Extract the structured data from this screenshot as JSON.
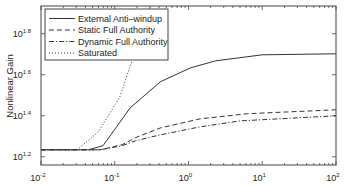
{
  "chart_data": {
    "type": "line",
    "title": "",
    "xlabel": "",
    "ylabel": "Nonlinear Gain",
    "xscale": "log",
    "yscale": "log",
    "xlim": [
      0.01,
      100
    ],
    "ylim_log10": [
      1.16,
      1.935
    ],
    "grid": false,
    "legend_position": "upper left",
    "x_ticks": [
      {
        "exp": "-2",
        "log": -2
      },
      {
        "exp": "-1",
        "log": -1
      },
      {
        "exp": "0",
        "log": 0
      },
      {
        "exp": "1",
        "log": 1
      },
      {
        "exp": "2",
        "log": 2
      }
    ],
    "y_ticks": [
      {
        "exp": "1.2",
        "log": 1.2
      },
      {
        "exp": "1.4",
        "log": 1.4
      },
      {
        "exp": "1.6",
        "log": 1.6
      },
      {
        "exp": "1.8",
        "log": 1.8
      }
    ],
    "tick_base": "10",
    "series": [
      {
        "name": "External Anti–windup",
        "style": "solid",
        "points_log10": [
          [
            -2,
            1.234
          ],
          [
            -1.36,
            1.234
          ],
          [
            -1.16,
            1.254
          ],
          [
            -0.79,
            1.439
          ],
          [
            -0.38,
            1.566
          ],
          [
            0.03,
            1.634
          ],
          [
            0.37,
            1.668
          ],
          [
            1.0,
            1.697
          ],
          [
            2.0,
            1.702
          ]
        ]
      },
      {
        "name": "Static Full Authority",
        "style": "dashed",
        "points_log10": [
          [
            -2,
            1.234
          ],
          [
            -1.2,
            1.234
          ],
          [
            -0.9,
            1.259
          ],
          [
            -0.72,
            1.293
          ],
          [
            -0.38,
            1.341
          ],
          [
            0.16,
            1.385
          ],
          [
            0.8,
            1.41
          ],
          [
            2.0,
            1.429
          ]
        ]
      },
      {
        "name": "Dynamic Full Authority",
        "style": "dashdot",
        "points_log10": [
          [
            -2,
            1.234
          ],
          [
            -1.2,
            1.234
          ],
          [
            -0.9,
            1.254
          ],
          [
            -0.72,
            1.278
          ],
          [
            -0.38,
            1.307
          ],
          [
            0.16,
            1.346
          ],
          [
            0.7,
            1.375
          ],
          [
            2.0,
            1.4
          ]
        ]
      },
      {
        "name": "Saturated",
        "style": "dotted",
        "points_log10": [
          [
            -2,
            1.234
          ],
          [
            -1.51,
            1.234
          ],
          [
            -1.22,
            1.322
          ],
          [
            -0.93,
            1.493
          ],
          [
            -0.76,
            1.673
          ],
          [
            -0.6,
            1.85
          ],
          [
            -0.5,
            1.95
          ]
        ]
      }
    ]
  },
  "legend": {
    "items": [
      {
        "label": "External Anti–windup",
        "style": "solid"
      },
      {
        "label": "Static Full Authority",
        "style": "dashed"
      },
      {
        "label": "Dynamic Full Authority",
        "style": "dashdot"
      },
      {
        "label": "Saturated",
        "style": "dotted"
      }
    ]
  },
  "axes": {
    "ylabel": "Nonlinear Gain"
  },
  "colors": {
    "line": "#333333",
    "axis": "#444444",
    "background": "#ffffff"
  }
}
